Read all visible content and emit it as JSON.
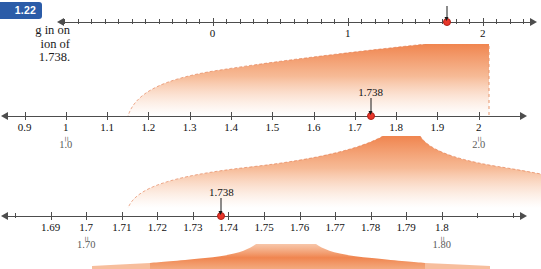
{
  "figure": {
    "badge_label": "1.22",
    "caption_lines": [
      "g in on",
      "ion of",
      "1.738."
    ],
    "highlight_value": "1.738",
    "accent_color": "#f08a55",
    "badge_color": "#2b5ca8",
    "marker_color": "#e8362a",
    "axis_color": "#4d4d4d"
  },
  "number_lines": [
    {
      "name": "line-1",
      "range": [
        -1.1,
        2.35
      ],
      "major_ticks": [
        {
          "value": 0,
          "label": "0"
        },
        {
          "value": 1,
          "label": "1"
        },
        {
          "value": 2,
          "label": "2"
        }
      ],
      "minor_step": 0.1,
      "marker": {
        "value": 1.738,
        "label": "",
        "show_label": false
      },
      "arrows": [
        "left",
        "right"
      ]
    },
    {
      "name": "line-2",
      "range": [
        0.86,
        2.1
      ],
      "major_ticks": [
        {
          "value": 0.9,
          "label": "0.9"
        },
        {
          "value": 1.0,
          "label": "1",
          "sub_label": "1.0"
        },
        {
          "value": 1.1,
          "label": "1.1"
        },
        {
          "value": 1.2,
          "label": "1.2"
        },
        {
          "value": 1.3,
          "label": "1.3"
        },
        {
          "value": 1.4,
          "label": "1.4"
        },
        {
          "value": 1.5,
          "label": "1.5"
        },
        {
          "value": 1.6,
          "label": "1.6"
        },
        {
          "value": 1.7,
          "label": "1.7"
        },
        {
          "value": 1.8,
          "label": "1.8"
        },
        {
          "value": 1.9,
          "label": "1.9"
        },
        {
          "value": 2.0,
          "label": "2",
          "sub_label": "2.0"
        }
      ],
      "minor_step": 0.1,
      "marker": {
        "value": 1.738,
        "label": "1.738",
        "show_label": true
      },
      "arrows": [
        "left",
        "right"
      ]
    },
    {
      "name": "line-3",
      "range": [
        1.678,
        1.822
      ],
      "major_ticks": [
        {
          "value": 1.69,
          "label": "1.69"
        },
        {
          "value": 1.7,
          "label": "1.7",
          "sub_label": "1.70"
        },
        {
          "value": 1.71,
          "label": "1.71"
        },
        {
          "value": 1.72,
          "label": "1.72"
        },
        {
          "value": 1.73,
          "label": "1.73"
        },
        {
          "value": 1.74,
          "label": "1.74"
        },
        {
          "value": 1.75,
          "label": "1.75"
        },
        {
          "value": 1.76,
          "label": "1.76"
        },
        {
          "value": 1.77,
          "label": "1.77"
        },
        {
          "value": 1.78,
          "label": "1.78"
        },
        {
          "value": 1.79,
          "label": "1.79"
        },
        {
          "value": 1.8,
          "label": "1.8",
          "sub_label": "1.80"
        }
      ],
      "minor_step": 0.01,
      "marker": {
        "value": 1.738,
        "label": "1.738",
        "show_label": true
      },
      "arrows": [
        "left",
        "right"
      ]
    }
  ]
}
